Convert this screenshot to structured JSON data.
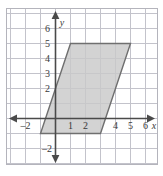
{
  "chart_data": {
    "type": "scatter",
    "title": "",
    "subtitle": "",
    "xlabel": "x",
    "ylabel": "y",
    "xlim": [
      -3.2,
      7.0
    ],
    "ylim": [
      -3.0,
      7.4
    ],
    "grid": true,
    "grid_step": 1,
    "legend": "none",
    "axis_origin": [
      0,
      0
    ],
    "x_tick_labels": [
      "-2",
      "1",
      "2",
      "4",
      "5",
      "6"
    ],
    "x_tick_values": [
      -2,
      1,
      2,
      4,
      5,
      6
    ],
    "y_tick_labels": [
      "6",
      "5",
      "4",
      "3",
      "2",
      "-2"
    ],
    "y_tick_values": [
      6,
      5,
      4,
      3,
      2,
      -2
    ],
    "shapes": [
      {
        "name": "parallelogram",
        "kind": "polygon",
        "fill": "#c9c9c9",
        "stroke": "#6f6f6f",
        "vertices": [
          [
            1,
            5
          ],
          [
            5,
            5
          ],
          [
            3,
            -1
          ],
          [
            -1,
            -1
          ]
        ]
      }
    ],
    "colors": {
      "grid": "#c0c0c8",
      "frame": "#b4b4bc",
      "axis": "#4a4a4a",
      "shape_fill": "#c9c9c9",
      "shape_stroke": "#6f6f6f",
      "label": "#3a3a3a",
      "background": "#ffffff"
    }
  },
  "labels": {
    "x_axis_name": "x",
    "y_axis_name": "y",
    "x": {
      "m2": "–2",
      "p1": "1",
      "p2": "2",
      "p4": "4",
      "p5": "5",
      "p6": "6"
    },
    "y": {
      "p6": "6",
      "p5": "5",
      "p4": "4",
      "p3": "3",
      "p2": "2",
      "m2": "–2"
    }
  }
}
